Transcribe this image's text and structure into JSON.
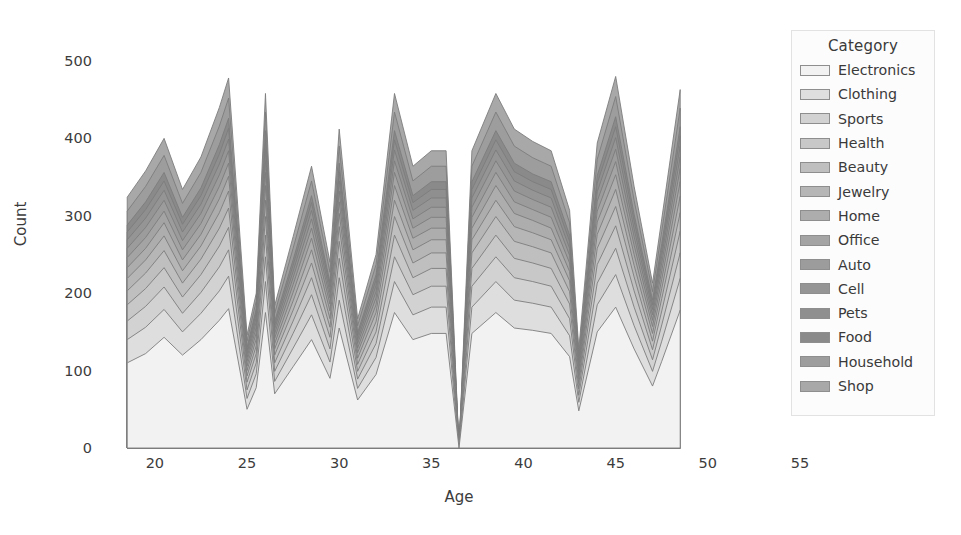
{
  "chart_data": {
    "type": "area",
    "stacked": true,
    "title": "",
    "xlabel": "Age",
    "ylabel": "Count",
    "xlim": [
      18.0,
      55.0
    ],
    "ylim": [
      0,
      540
    ],
    "xticks": [
      20,
      25,
      30,
      35,
      40,
      45,
      50,
      55
    ],
    "yticks": [
      0,
      100,
      200,
      300,
      400,
      500
    ],
    "grid": false,
    "legend_title": "Category",
    "legend_position": "upper right",
    "x": [
      18.5,
      19.5,
      20.5,
      21.5,
      22.5,
      23.5,
      24.0,
      25.0,
      25.5,
      26.0,
      26.5,
      27.5,
      28.5,
      29.5,
      30.0,
      31.0,
      32.0,
      33.0,
      34.0,
      35.0,
      35.8,
      36.5,
      37.2,
      38.5,
      39.5,
      40.5,
      41.5,
      42.5,
      43.0,
      44.0,
      45.0,
      46.0,
      47.0,
      47.5,
      48.5
    ],
    "series": [
      {
        "name": "Electronics",
        "color": "#f2f2f2",
        "values": [
          110,
          122,
          143,
          120,
          140,
          165,
          180,
          50,
          78,
          175,
          70,
          105,
          140,
          90,
          155,
          62,
          95,
          175,
          140,
          148,
          148,
          0,
          148,
          175,
          155,
          152,
          148,
          118,
          48,
          150,
          182,
          128,
          80,
          112,
          178
        ]
      },
      {
        "name": "Clothing",
        "color": "#dedede",
        "values": [
          30,
          34,
          36,
          30,
          34,
          38,
          42,
          14,
          18,
          40,
          16,
          24,
          32,
          21,
          36,
          15,
          22,
          40,
          32,
          34,
          34,
          0,
          34,
          40,
          36,
          35,
          34,
          27,
          11,
          35,
          42,
          30,
          19,
          26,
          41
        ]
      },
      {
        "name": "Sports",
        "color": "#d2d2d2",
        "values": [
          24,
          27,
          29,
          24,
          27,
          31,
          34,
          11,
          14,
          32,
          13,
          19,
          26,
          17,
          29,
          12,
          18,
          32,
          26,
          27,
          27,
          0,
          27,
          32,
          29,
          28,
          27,
          22,
          9,
          28,
          34,
          24,
          15,
          21,
          33
        ]
      },
      {
        "name": "Health",
        "color": "#c8c8c8",
        "values": [
          21,
          23,
          25,
          21,
          23,
          27,
          29,
          10,
          12,
          28,
          11,
          16,
          22,
          15,
          25,
          10,
          15,
          28,
          22,
          23,
          23,
          0,
          23,
          28,
          25,
          24,
          23,
          19,
          8,
          24,
          29,
          21,
          13,
          18,
          28
        ]
      },
      {
        "name": "Beauty",
        "color": "#bfbfbf",
        "values": [
          18,
          20,
          22,
          18,
          20,
          23,
          25,
          8,
          10,
          24,
          10,
          14,
          19,
          13,
          22,
          9,
          13,
          24,
          19,
          20,
          20,
          0,
          20,
          24,
          22,
          21,
          20,
          16,
          7,
          21,
          25,
          18,
          11,
          16,
          24
        ]
      },
      {
        "name": "Jewelry",
        "color": "#b6b6b6",
        "values": [
          16,
          17,
          19,
          16,
          17,
          20,
          22,
          7,
          9,
          21,
          8,
          12,
          17,
          11,
          19,
          8,
          12,
          21,
          17,
          17,
          17,
          0,
          17,
          21,
          19,
          18,
          17,
          14,
          6,
          18,
          22,
          15,
          10,
          13,
          21
        ]
      },
      {
        "name": "Home",
        "color": "#adadad",
        "values": [
          14,
          15,
          17,
          14,
          15,
          18,
          19,
          6,
          8,
          19,
          7,
          11,
          15,
          10,
          17,
          7,
          10,
          19,
          15,
          15,
          15,
          0,
          15,
          19,
          17,
          16,
          15,
          12,
          5,
          16,
          19,
          14,
          9,
          12,
          19
        ]
      },
      {
        "name": "Office",
        "color": "#a4a4a4",
        "values": [
          13,
          14,
          15,
          13,
          14,
          16,
          17,
          6,
          7,
          17,
          7,
          10,
          13,
          9,
          15,
          6,
          9,
          17,
          13,
          14,
          14,
          0,
          14,
          17,
          15,
          14,
          14,
          11,
          5,
          14,
          17,
          12,
          8,
          11,
          17
        ]
      },
      {
        "name": "Auto",
        "color": "#9c9c9c",
        "values": [
          12,
          13,
          14,
          12,
          13,
          15,
          16,
          5,
          7,
          15,
          6,
          9,
          12,
          8,
          14,
          6,
          8,
          15,
          12,
          13,
          13,
          0,
          13,
          15,
          14,
          13,
          13,
          10,
          4,
          13,
          16,
          11,
          7,
          10,
          15
        ]
      },
      {
        "name": "Cell",
        "color": "#959595",
        "values": [
          11,
          12,
          13,
          11,
          12,
          14,
          15,
          5,
          6,
          14,
          6,
          8,
          11,
          7,
          13,
          5,
          8,
          14,
          11,
          12,
          12,
          0,
          12,
          14,
          13,
          12,
          12,
          9,
          4,
          12,
          15,
          10,
          7,
          9,
          14
        ]
      },
      {
        "name": "Pets",
        "color": "#8f8f8f",
        "values": [
          10,
          11,
          12,
          10,
          11,
          13,
          14,
          4,
          6,
          13,
          5,
          8,
          10,
          7,
          12,
          5,
          7,
          13,
          10,
          11,
          11,
          0,
          11,
          13,
          12,
          11,
          11,
          9,
          4,
          11,
          14,
          10,
          6,
          8,
          13
        ]
      },
      {
        "name": "Food",
        "color": "#8a8a8a",
        "values": [
          9,
          10,
          11,
          9,
          10,
          12,
          13,
          4,
          5,
          12,
          5,
          7,
          9,
          6,
          11,
          4,
          7,
          12,
          9,
          10,
          10,
          0,
          10,
          12,
          11,
          10,
          10,
          8,
          3,
          10,
          13,
          9,
          6,
          8,
          12
        ]
      },
      {
        "name": "Household",
        "color": "#9d9d9d",
        "values": [
          18,
          20,
          22,
          18,
          20,
          24,
          26,
          8,
          10,
          24,
          10,
          15,
          19,
          13,
          22,
          9,
          13,
          24,
          19,
          20,
          20,
          0,
          20,
          24,
          22,
          21,
          20,
          16,
          7,
          21,
          26,
          18,
          11,
          16,
          24
        ]
      },
      {
        "name": "Shop",
        "color": "#a8a8a8",
        "values": [
          18,
          20,
          22,
          18,
          20,
          24,
          26,
          8,
          10,
          24,
          10,
          15,
          19,
          13,
          22,
          9,
          13,
          24,
          19,
          20,
          20,
          0,
          20,
          24,
          22,
          21,
          20,
          16,
          7,
          21,
          26,
          18,
          11,
          16,
          24
        ]
      }
    ]
  },
  "axes": {
    "xlabel": "Age",
    "ylabel": "Count",
    "xticks": [
      "20",
      "25",
      "30",
      "35",
      "40",
      "45",
      "50",
      "55"
    ],
    "yticks": [
      "0",
      "100",
      "200",
      "300",
      "400",
      "500"
    ]
  },
  "legend": {
    "title": "Category",
    "items": [
      {
        "label": "Electronics",
        "color": "#f2f2f2"
      },
      {
        "label": "Clothing",
        "color": "#dedede"
      },
      {
        "label": "Sports",
        "color": "#d2d2d2"
      },
      {
        "label": "Health",
        "color": "#c8c8c8"
      },
      {
        "label": "Beauty",
        "color": "#bfbfbf"
      },
      {
        "label": "Jewelry",
        "color": "#b6b6b6"
      },
      {
        "label": "Home",
        "color": "#adadad"
      },
      {
        "label": "Office",
        "color": "#a4a4a4"
      },
      {
        "label": "Auto",
        "color": "#9c9c9c"
      },
      {
        "label": "Cell",
        "color": "#959595"
      },
      {
        "label": "Pets",
        "color": "#8f8f8f"
      },
      {
        "label": "Food",
        "color": "#8a8a8a"
      },
      {
        "label": "Household",
        "color": "#9d9d9d"
      },
      {
        "label": "Shop",
        "color": "#a8a8a8"
      }
    ]
  }
}
